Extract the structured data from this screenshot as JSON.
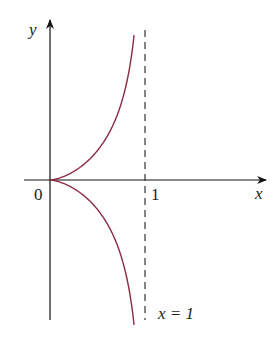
{
  "chart_data": {
    "type": "line",
    "title": "",
    "xlabel": "x",
    "ylabel": "y",
    "equation": "y^2 = x^3/(1-x)",
    "origin_label": "0",
    "x_ticks": [
      {
        "value": 1,
        "label": "1"
      }
    ],
    "asymptote": {
      "x": 1,
      "label": "x = 1",
      "style": "dashed"
    },
    "xlim": [
      -0.27,
      2.28
    ],
    "ylim": [
      -2.4,
      2.7
    ],
    "grid": false,
    "legend": null,
    "series": [
      {
        "name": "upper branch",
        "x": [
          0,
          0.2,
          0.4,
          0.6,
          0.7,
          0.8,
          0.85,
          0.885
        ],
        "y": [
          0,
          0.1,
          0.33,
          0.73,
          1.07,
          1.6,
          2.02,
          2.45
        ]
      },
      {
        "name": "lower branch",
        "x": [
          0,
          0.2,
          0.4,
          0.6,
          0.7,
          0.8,
          0.85,
          0.885
        ],
        "y": [
          0,
          -0.1,
          -0.33,
          -0.73,
          -1.07,
          -1.6,
          -2.02,
          -2.45
        ]
      }
    ],
    "colors": {
      "curve": "#8b2a42",
      "axes": "#111111",
      "asymptote": "#333333"
    }
  }
}
